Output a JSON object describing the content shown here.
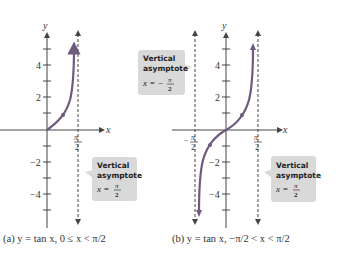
{
  "figure": {
    "panel_a": {
      "caption": "(a) y = tan x, 0 ≤ x < π/2",
      "x_axis_label": "x",
      "y_axis_label": "y",
      "y_ticks": [
        "4",
        "2",
        "−2",
        "−4"
      ],
      "x_tick": "π/2",
      "callout": {
        "line1": "Vertical",
        "line2": "asymptote",
        "equation": "x = π/2"
      }
    },
    "panel_b": {
      "caption": "(b) y = tan x, −π/2 < x < π/2",
      "x_axis_label": "x",
      "y_axis_label": "y",
      "y_ticks": [
        "4",
        "2",
        "−2",
        "−4"
      ],
      "x_ticks": [
        "−π/2",
        "π/2"
      ],
      "callout_left": {
        "line1": "Vertical",
        "line2": "asymptote",
        "equation": "x = −π/2"
      },
      "callout_right": {
        "line1": "Vertical",
        "line2": "asymptote",
        "equation": "x = π/2"
      }
    },
    "colors": {
      "curve": "#6e5a7e",
      "callout_bg": "#d9d9d9",
      "axis": "#444444"
    }
  }
}
